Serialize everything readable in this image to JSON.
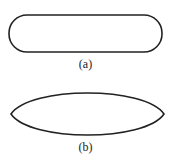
{
  "figure": {
    "shapes": [
      {
        "id": "a",
        "type": "rounded-rectangle",
        "label": "(a)"
      },
      {
        "id": "b",
        "type": "ellipse",
        "label": "(b)"
      }
    ],
    "stroke_color": "#222222"
  }
}
